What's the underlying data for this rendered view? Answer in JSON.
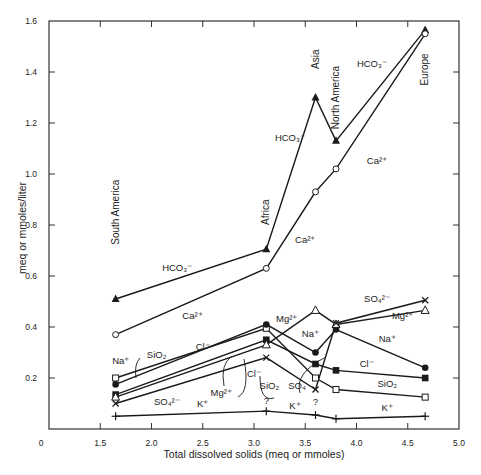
{
  "chart_data": {
    "type": "line",
    "title": "",
    "xlabel": "Total dissolved solids (meq or mmoles)",
    "ylabel": "meq or mmoles/liter",
    "xlim": [
      1.0,
      5.0
    ],
    "ylim": [
      0,
      1.6
    ],
    "x_origin_label": "0",
    "x_ticks": [
      1.5,
      2.0,
      2.5,
      3.0,
      3.5,
      4.0,
      4.5,
      5.0
    ],
    "x_tick_labels": [
      "1.5",
      "2.0",
      "2.5",
      "3.0",
      "3.5",
      "4.0",
      "4.5",
      "5.0"
    ],
    "y_ticks": [
      0.2,
      0.4,
      0.6,
      0.8,
      1.0,
      1.2,
      1.4,
      1.6
    ],
    "y_tick_labels": [
      "0.2",
      "0.4",
      "0.6",
      "0.8",
      "1.0",
      "1.2",
      "1.4",
      "1.6"
    ],
    "grid": false,
    "legend": "inline labels",
    "categories": [
      "South America",
      "Africa",
      "Asia",
      "North America",
      "Europe"
    ],
    "x": [
      1.65,
      3.12,
      3.6,
      3.8,
      4.67
    ],
    "series": [
      {
        "name": "HCO3-",
        "marker": "filled-triangle",
        "values": [
          0.51,
          0.705,
          1.3,
          1.13,
          1.565
        ]
      },
      {
        "name": "Ca2+",
        "marker": "open-circle",
        "values": [
          0.37,
          0.63,
          0.93,
          1.02,
          1.55
        ]
      },
      {
        "name": "SiO2",
        "marker": "open-square",
        "values": [
          0.2,
          0.395,
          0.2,
          0.155,
          0.125
        ]
      },
      {
        "name": "Na+",
        "marker": "filled-circle",
        "values": [
          0.175,
          0.41,
          0.3,
          0.39,
          0.24
        ]
      },
      {
        "name": "Cl-",
        "marker": "filled-square",
        "values": [
          0.135,
          0.35,
          0.255,
          0.23,
          0.2
        ]
      },
      {
        "name": "Mg2+",
        "marker": "open-triangle",
        "values": [
          0.125,
          0.33,
          0.465,
          0.41,
          0.465
        ]
      },
      {
        "name": "SO4 2-",
        "marker": "cross",
        "values": [
          0.1,
          0.28,
          0.155,
          0.415,
          0.505
        ]
      },
      {
        "name": "K+",
        "marker": "plus",
        "values": [
          0.05,
          0.07,
          0.055,
          0.04,
          0.05
        ]
      }
    ],
    "region_labels": [
      {
        "text": "South America",
        "x": 1.65,
        "y": 0.85
      },
      {
        "text": "Africa",
        "x": 3.12,
        "y": 0.85
      },
      {
        "text": "Asia",
        "x": 3.6,
        "y": 1.45
      },
      {
        "text": "North America",
        "x": 3.8,
        "y": 1.3
      },
      {
        "text": "Europe",
        "x": 4.67,
        "y": 1.41
      }
    ],
    "annotations": [
      {
        "text": "HCO₃⁻",
        "x": 2.25,
        "y": 0.62
      },
      {
        "text": "Ca²⁺",
        "x": 2.4,
        "y": 0.43
      },
      {
        "text": "HCO₃⁻",
        "x": 3.35,
        "y": 1.13
      },
      {
        "text": "Ca²⁺",
        "x": 3.5,
        "y": 0.73
      },
      {
        "text": "HCO₃⁻",
        "x": 4.15,
        "y": 1.42
      },
      {
        "text": "Ca²⁺",
        "x": 4.2,
        "y": 1.04
      },
      {
        "text": "Na⁺",
        "x": 1.7,
        "y": 0.255
      },
      {
        "text": "SiO₂",
        "x": 2.05,
        "y": 0.28
      },
      {
        "text": "Cl⁻",
        "x": 2.5,
        "y": 0.31
      },
      {
        "text": "Mg²⁺",
        "x": 2.68,
        "y": 0.13
      },
      {
        "text": "SO₄²⁻",
        "x": 2.15,
        "y": 0.095
      },
      {
        "text": "K⁺",
        "x": 2.5,
        "y": 0.085
      },
      {
        "text": "Mg²⁺",
        "x": 3.32,
        "y": 0.42
      },
      {
        "text": "Na⁺",
        "x": 3.55,
        "y": 0.36
      },
      {
        "text": "Cl⁻",
        "x": 3.0,
        "y": 0.205
      },
      {
        "text": "SiO₂",
        "x": 3.15,
        "y": 0.155
      },
      {
        "text": "SO₄",
        "x": 3.42,
        "y": 0.155
      },
      {
        "text": "?",
        "x": 3.12,
        "y": 0.1
      },
      {
        "text": "K⁺",
        "x": 3.4,
        "y": 0.08
      },
      {
        "text": "?",
        "x": 3.6,
        "y": 0.095
      },
      {
        "text": "SO₄²⁻",
        "x": 4.2,
        "y": 0.5
      },
      {
        "text": "Mg²⁺",
        "x": 4.45,
        "y": 0.43
      },
      {
        "text": "Na⁺",
        "x": 4.3,
        "y": 0.34
      },
      {
        "text": "Cl⁻",
        "x": 4.1,
        "y": 0.245
      },
      {
        "text": "SiO₂",
        "x": 4.3,
        "y": 0.165
      },
      {
        "text": "K⁺",
        "x": 4.3,
        "y": 0.07
      }
    ]
  }
}
